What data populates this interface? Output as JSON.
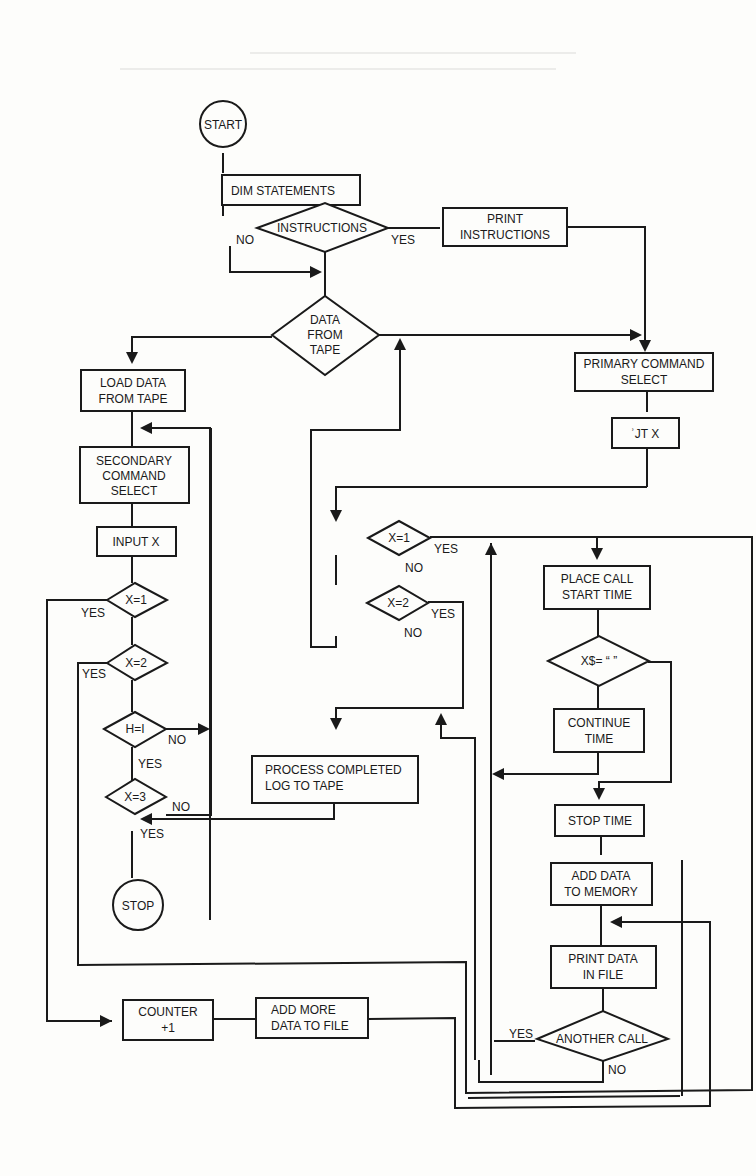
{
  "diagram": {
    "type": "flowchart",
    "colors": {
      "ink": "#1a1a1a",
      "paper": "#fdfdfb"
    },
    "nodes": {
      "start": {
        "shape": "circle",
        "label": "START"
      },
      "dim": {
        "shape": "rect",
        "label": "DIM STATEMENTS"
      },
      "instructions": {
        "shape": "diamond",
        "label": "INSTRUCTIONS",
        "yes": "YES",
        "no": "NO"
      },
      "print_instructions": {
        "shape": "rect",
        "line1": "PRINT",
        "line2": "INSTRUCTIONS"
      },
      "data_from_tape": {
        "shape": "diamond",
        "line1": "DATA",
        "line2": "FROM",
        "line3": "TAPE"
      },
      "load_data": {
        "shape": "rect",
        "line1": "LOAD DATA",
        "line2": "FROM TAPE"
      },
      "secondary": {
        "shape": "rect",
        "line1": "SECONDARY",
        "line2": "COMMAND",
        "line3": "SELECT"
      },
      "input_x_left": {
        "shape": "rect",
        "label": "INPUT X"
      },
      "lx1": {
        "shape": "diamond",
        "label": "X=1",
        "yes": "YES"
      },
      "lx2": {
        "shape": "diamond",
        "label": "X=2",
        "yes": "YES"
      },
      "h1": {
        "shape": "diamond",
        "label": "H=I",
        "no": "NO",
        "yes": "YES"
      },
      "lx3": {
        "shape": "diamond",
        "label": "X=3",
        "no": "NO",
        "yes": "YES"
      },
      "stop": {
        "shape": "circle",
        "label": "STOP"
      },
      "primary": {
        "shape": "rect",
        "line1": "PRIMARY COMMAND",
        "line2": "SELECT"
      },
      "input_x_right": {
        "shape": "rect",
        "label": "ʾJT X"
      },
      "cx1": {
        "shape": "diamond",
        "label": "X=1",
        "yes": "YES",
        "no": "NO"
      },
      "cx2": {
        "shape": "diamond",
        "label": "X=2",
        "yes": "YES",
        "no": "NO"
      },
      "process_completed": {
        "shape": "rect",
        "line1": "PROCESS COMPLETED",
        "line2": "LOG TO TAPE"
      },
      "place_call": {
        "shape": "rect",
        "line1": "PLACE CALL",
        "line2": "START TIME"
      },
      "xs_check": {
        "shape": "diamond",
        "label": "X$= “  ”"
      },
      "continue_time": {
        "shape": "rect",
        "line1": "CONTINUE",
        "line2": "TIME"
      },
      "stop_time": {
        "shape": "rect",
        "label": "STOP TIME"
      },
      "add_memory": {
        "shape": "rect",
        "line1": "ADD DATA",
        "line2": "TO MEMORY"
      },
      "print_file": {
        "shape": "rect",
        "line1": "PRINT DATA",
        "line2": "IN FILE"
      },
      "another_call": {
        "shape": "diamond",
        "label": "ANOTHER CALL",
        "yes": "YES",
        "no": "NO"
      },
      "counter": {
        "shape": "rect",
        "line1": "COUNTER",
        "line2": "+1"
      },
      "add_more": {
        "shape": "rect",
        "line1": "ADD MORE",
        "line2": "DATA TO FILE"
      }
    }
  }
}
